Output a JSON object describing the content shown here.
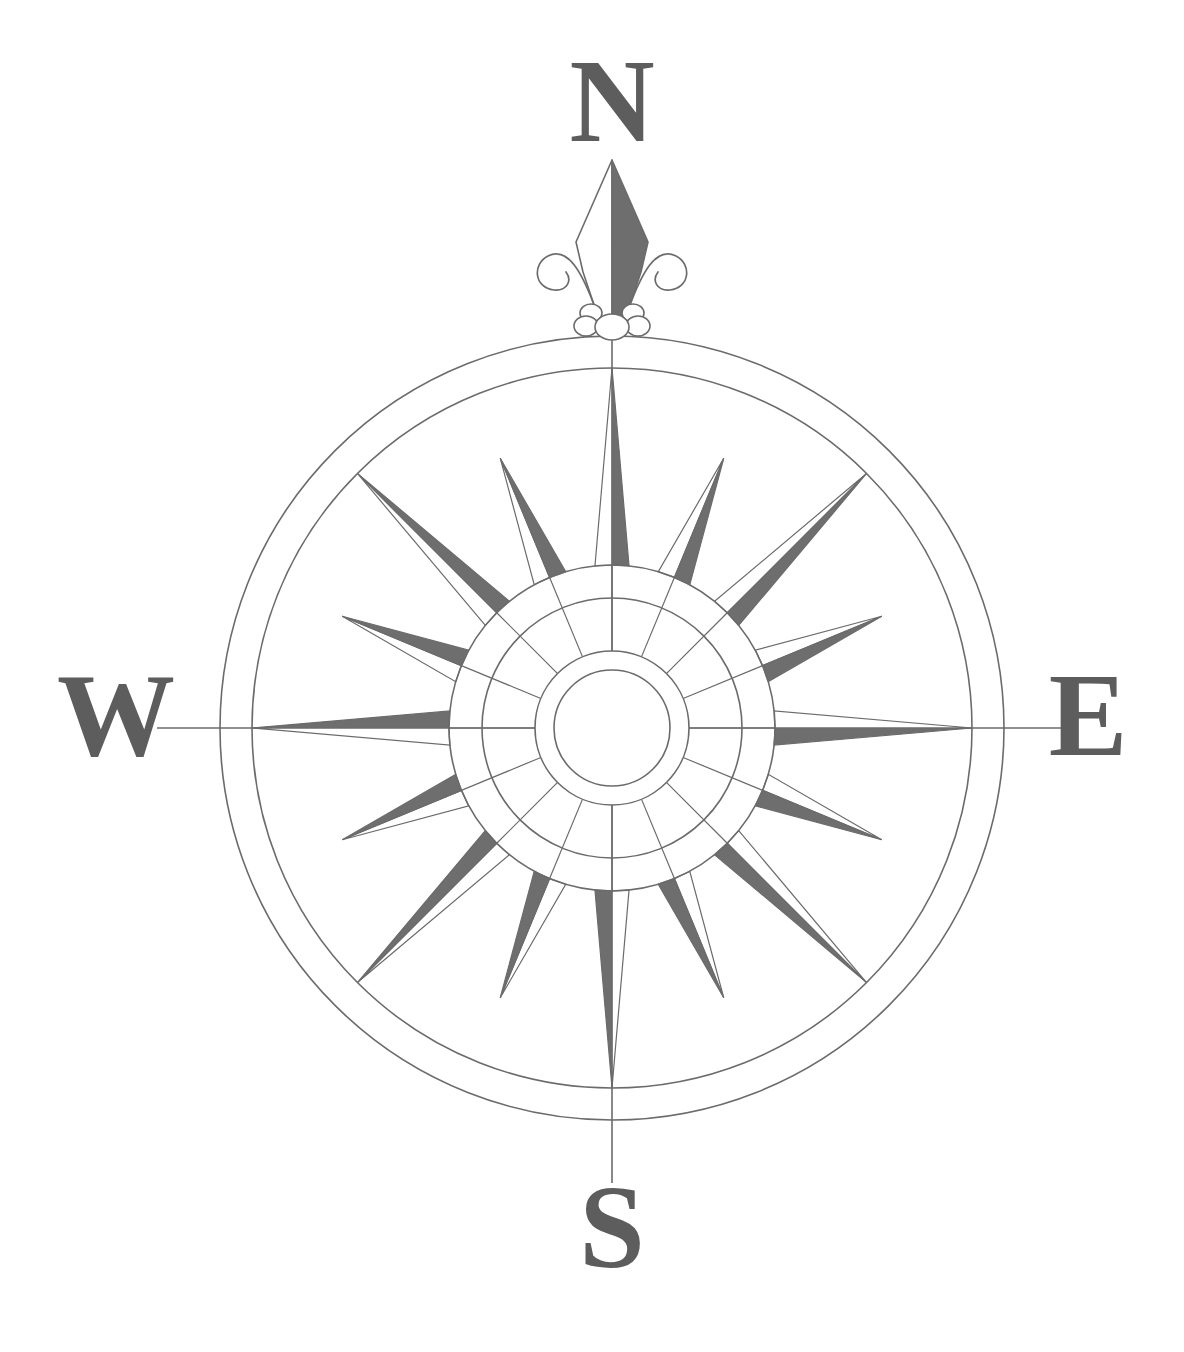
{
  "figure": {
    "kind": "compass-rose",
    "background_color": "#ffffff"
  },
  "labels": {
    "north": "N",
    "east": "E",
    "south": "S",
    "west": "W"
  },
  "colors": {
    "ray_dark": "#6e6e6e",
    "ray_light": "#ffffff",
    "stroke": "#6b6b6b",
    "letter": "#5d5d5d",
    "background": "#ffffff"
  },
  "geometry": {
    "center_x": 612,
    "center_y": 728,
    "ring_outer_radius": 392,
    "ring_inner_radius": 360,
    "major_ray_radius": 360,
    "minor_ray_radius": 292,
    "collar_outer_radius": 163,
    "collar_inner_radius": 130,
    "hub_outer_radius": 77,
    "hub_inner_radius": 58,
    "ray_count": 16,
    "major_ray_count": 8,
    "minor_ray_count": 8,
    "spoke_count": 16,
    "ray_half_angle_deg": 6.0,
    "axis_line_extent": 455
  },
  "points": [
    {
      "name": "N",
      "angle_deg": 0,
      "class": "major",
      "labeled": true
    },
    {
      "name": "NNE",
      "angle_deg": 22.5,
      "class": "minor",
      "labeled": false
    },
    {
      "name": "NE",
      "angle_deg": 45,
      "class": "major",
      "labeled": false
    },
    {
      "name": "ENE",
      "angle_deg": 67.5,
      "class": "minor",
      "labeled": false
    },
    {
      "name": "E",
      "angle_deg": 90,
      "class": "major",
      "labeled": true
    },
    {
      "name": "ESE",
      "angle_deg": 112.5,
      "class": "minor",
      "labeled": false
    },
    {
      "name": "SE",
      "angle_deg": 135,
      "class": "major",
      "labeled": false
    },
    {
      "name": "SSE",
      "angle_deg": 157.5,
      "class": "minor",
      "labeled": false
    },
    {
      "name": "S",
      "angle_deg": 180,
      "class": "major",
      "labeled": true
    },
    {
      "name": "SSW",
      "angle_deg": 202.5,
      "class": "minor",
      "labeled": false
    },
    {
      "name": "SW",
      "angle_deg": 225,
      "class": "major",
      "labeled": false
    },
    {
      "name": "WSW",
      "angle_deg": 247.5,
      "class": "minor",
      "labeled": false
    },
    {
      "name": "W",
      "angle_deg": 270,
      "class": "major",
      "labeled": true
    },
    {
      "name": "WNW",
      "angle_deg": 292.5,
      "class": "minor",
      "labeled": false
    },
    {
      "name": "NW",
      "angle_deg": 315,
      "class": "major",
      "labeled": false
    },
    {
      "name": "NNW",
      "angle_deg": 337.5,
      "class": "minor",
      "labeled": false
    }
  ],
  "ornament": {
    "name": "fleur-de-lis",
    "position": "north",
    "tip_y": 160,
    "base_y": 332
  },
  "label_positions": {
    "north": {
      "x": 612,
      "y": 114
    },
    "east": {
      "x": 1088,
      "y": 728
    },
    "south": {
      "x": 612,
      "y": 1240
    },
    "west": {
      "x": 116,
      "y": 728
    }
  }
}
